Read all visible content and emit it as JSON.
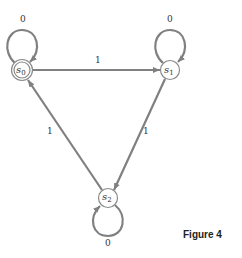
{
  "diagram": {
    "type": "finite-state-machine",
    "colors": {
      "edge": "#808080",
      "node_stroke": "#8a8a8a",
      "text": "#333333"
    },
    "states": [
      {
        "id": "s0",
        "label": "s",
        "sub": "0",
        "x": 22,
        "y": 70,
        "accepting": true
      },
      {
        "id": "s1",
        "label": "s",
        "sub": "1",
        "x": 170,
        "y": 70,
        "accepting": false
      },
      {
        "id": "s2",
        "label": "s",
        "sub": "2",
        "x": 108,
        "y": 198,
        "accepting": false
      }
    ],
    "transitions": [
      {
        "from": "s0",
        "to": "s0",
        "label": "0"
      },
      {
        "from": "s1",
        "to": "s1",
        "label": "0"
      },
      {
        "from": "s2",
        "to": "s2",
        "label": "0"
      },
      {
        "from": "s0",
        "to": "s1",
        "label": "1"
      },
      {
        "from": "s1",
        "to": "s2",
        "label": "1"
      },
      {
        "from": "s2",
        "to": "s0",
        "label": "1"
      }
    ]
  },
  "caption": "Figure 4"
}
